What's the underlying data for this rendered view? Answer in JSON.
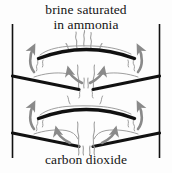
{
  "figure": {
    "title_top_line1": "brine saturated",
    "title_top_line2": "in ammonia",
    "title_bottom": "carbon dioxide",
    "colors": {
      "background": "#fdfdfd",
      "structure_line": "#111111",
      "arrow_gray": "#8a8a8a",
      "vapor_gray": "#9a9a9a",
      "text": "#141414"
    }
  },
  "diagram": {
    "type": "process-cross-section",
    "column_walls": [
      {
        "name": "left-wall",
        "x": 12,
        "y_top": 24,
        "y_bottom": 158
      },
      {
        "name": "right-wall",
        "x": 160,
        "y_top": 24,
        "y_bottom": 158
      }
    ],
    "trays": [
      {
        "name": "upper-arched-tray",
        "shape": "arc",
        "x_start": 38,
        "x_end": 135,
        "y_ends": 58,
        "y_peak": 47
      },
      {
        "name": "upper-downcomer-left",
        "shape": "line",
        "x1": 12,
        "y1": 76,
        "x2": 78,
        "y2": 89
      },
      {
        "name": "upper-downcomer-right",
        "shape": "line",
        "x1": 160,
        "y1": 76,
        "x2": 94,
        "y2": 89
      },
      {
        "name": "lower-arched-tray",
        "shape": "arc",
        "x_start": 38,
        "x_end": 135,
        "y_ends": 118,
        "y_peak": 107
      },
      {
        "name": "lower-downcomer-left",
        "shape": "line",
        "x1": 12,
        "y1": 133,
        "x2": 78,
        "y2": 146
      },
      {
        "name": "lower-downcomer-right",
        "shape": "line",
        "x1": 160,
        "y1": 133,
        "x2": 94,
        "y2": 146
      }
    ],
    "flow_arrows": [
      {
        "name": "gas-arrow-upper-left",
        "direction": "up"
      },
      {
        "name": "gas-arrow-upper-right",
        "direction": "up"
      },
      {
        "name": "gas-arrow-upper-center-left",
        "direction": "up-left"
      },
      {
        "name": "gas-arrow-upper-center-right",
        "direction": "up-right"
      },
      {
        "name": "gas-arrow-lower-left",
        "direction": "up"
      },
      {
        "name": "gas-arrow-lower-right",
        "direction": "up"
      },
      {
        "name": "gas-arrow-lower-center-left",
        "direction": "up-left"
      },
      {
        "name": "gas-arrow-lower-center-right",
        "direction": "up-right"
      }
    ],
    "vapor_streams": [
      {
        "name": "vapor-top-center"
      },
      {
        "name": "vapor-upper-tray-left"
      },
      {
        "name": "vapor-upper-tray-right"
      },
      {
        "name": "vapor-mid-center-left"
      },
      {
        "name": "vapor-mid-center-right"
      },
      {
        "name": "vapor-lower-tray-left"
      },
      {
        "name": "vapor-lower-tray-right"
      },
      {
        "name": "vapor-bottom-center-left"
      },
      {
        "name": "vapor-bottom-center-right"
      }
    ]
  }
}
